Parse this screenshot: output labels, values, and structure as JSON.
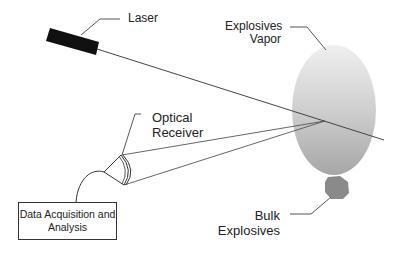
{
  "diagram": {
    "type": "schematic",
    "labels": {
      "laser": "Laser",
      "vapor_line1": "Explosives",
      "vapor_line2": "Vapor",
      "receiver_line1": "Optical",
      "receiver_line2": "Receiver",
      "bulk_line1": "Bulk",
      "bulk_line2": "Explosives",
      "daq_line1": "Data Acquisition and",
      "daq_line2": "Analysis"
    },
    "colors": {
      "laser_body": "#111111",
      "line": "#444444",
      "vapor_top": "#ededed",
      "vapor_bottom": "#a8a8a8",
      "bulk": "#8a8a8a",
      "text": "#222222"
    }
  }
}
